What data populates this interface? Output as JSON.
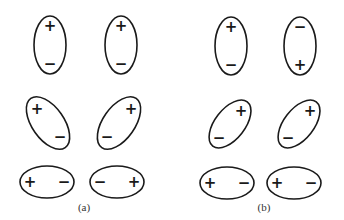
{
  "figure": {
    "panels": [
      {
        "label": "(a)",
        "label_pos": {
          "x": 84,
          "y": 207
        },
        "ellipses": [
          {
            "cx": 50,
            "cy": 45,
            "rx": 16,
            "ry": 29,
            "rot": 0,
            "signs": [
              {
                "text": "+",
                "dx": 0,
                "dy": -19
              },
              {
                "text": "−",
                "dx": 0,
                "dy": 19
              }
            ]
          },
          {
            "cx": 121,
            "cy": 45,
            "rx": 16,
            "ry": 29,
            "rot": 0,
            "signs": [
              {
                "text": "+",
                "dx": 0,
                "dy": -19
              },
              {
                "text": "−",
                "dx": 0,
                "dy": 19
              }
            ]
          },
          {
            "cx": 48,
            "cy": 123,
            "rx": 16,
            "ry": 30,
            "rot": -35,
            "signs": [
              {
                "text": "+",
                "dx": -11,
                "dy": -14
              },
              {
                "text": "−",
                "dx": 12,
                "dy": 14
              }
            ]
          },
          {
            "cx": 119,
            "cy": 123,
            "rx": 16,
            "ry": 30,
            "rot": 35,
            "signs": [
              {
                "text": "+",
                "dx": 12,
                "dy": -14
              },
              {
                "text": "−",
                "dx": -12,
                "dy": 14
              }
            ]
          },
          {
            "cx": 47,
            "cy": 182,
            "rx": 27,
            "ry": 16,
            "rot": 0,
            "signs": [
              {
                "text": "+",
                "dx": -17,
                "dy": 0
              },
              {
                "text": "−",
                "dx": 17,
                "dy": 0
              }
            ]
          },
          {
            "cx": 117,
            "cy": 182,
            "rx": 27,
            "ry": 16,
            "rot": 0,
            "signs": [
              {
                "text": "−",
                "dx": -17,
                "dy": 0
              },
              {
                "text": "+",
                "dx": 17,
                "dy": 0
              }
            ]
          }
        ]
      },
      {
        "label": "(b)",
        "label_pos": {
          "x": 264,
          "y": 207
        },
        "ellipses": [
          {
            "cx": 231,
            "cy": 46,
            "rx": 16,
            "ry": 29,
            "rot": 0,
            "signs": [
              {
                "text": "+",
                "dx": 0,
                "dy": -19
              },
              {
                "text": "−",
                "dx": 0,
                "dy": 19
              }
            ]
          },
          {
            "cx": 300,
            "cy": 46,
            "rx": 16,
            "ry": 29,
            "rot": 0,
            "signs": [
              {
                "text": "−",
                "dx": 0,
                "dy": -19
              },
              {
                "text": "+",
                "dx": 0,
                "dy": 19
              }
            ]
          },
          {
            "cx": 230,
            "cy": 124,
            "rx": 15,
            "ry": 28,
            "rot": 38,
            "signs": [
              {
                "text": "+",
                "dx": 11,
                "dy": -13
              },
              {
                "text": "−",
                "dx": -11,
                "dy": 14
              }
            ]
          },
          {
            "cx": 299,
            "cy": 124,
            "rx": 15,
            "ry": 28,
            "rot": 38,
            "signs": [
              {
                "text": "+",
                "dx": 11,
                "dy": -13
              },
              {
                "text": "−",
                "dx": -11,
                "dy": 14
              }
            ]
          },
          {
            "cx": 227,
            "cy": 183,
            "rx": 27,
            "ry": 16,
            "rot": 0,
            "signs": [
              {
                "text": "+",
                "dx": -17,
                "dy": 0
              },
              {
                "text": "−",
                "dx": 17,
                "dy": 0
              }
            ]
          },
          {
            "cx": 294,
            "cy": 183,
            "rx": 27,
            "ry": 16,
            "rot": 0,
            "signs": [
              {
                "text": "+",
                "dx": -17,
                "dy": 0
              },
              {
                "text": "−",
                "dx": 17,
                "dy": 0
              }
            ]
          }
        ]
      }
    ]
  }
}
